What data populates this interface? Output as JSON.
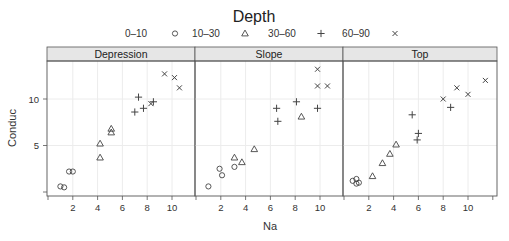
{
  "chart_data": {
    "type": "scatter",
    "title": "Depth",
    "xlabel": "Na",
    "ylabel": "Conduc",
    "xlim": [
      0,
      12
    ],
    "ylim": [
      0,
      14
    ],
    "xticks": [
      2,
      4,
      6,
      8,
      10
    ],
    "yticks": [
      5,
      10
    ],
    "grid": true,
    "legend_position": "top",
    "legend": [
      {
        "label": "0-10",
        "symbol": "circle"
      },
      {
        "label": "10-30",
        "symbol": "triangle"
      },
      {
        "label": "30-60",
        "symbol": "plus"
      },
      {
        "label": "60-90",
        "symbol": "cross"
      }
    ],
    "panels": [
      {
        "name": "Depression",
        "series": [
          {
            "name": "0-10",
            "x": [
              1.0,
              1.3,
              1.7,
              2.0
            ],
            "y": [
              0.6,
              0.5,
              2.2,
              2.2
            ]
          },
          {
            "name": "10-30",
            "x": [
              4.2,
              4.2,
              5.1,
              5.1
            ],
            "y": [
              5.2,
              3.7,
              6.8,
              6.4
            ]
          },
          {
            "name": "30-60",
            "x": [
              7.3,
              7.0,
              7.7,
              8.5
            ],
            "y": [
              10.2,
              8.6,
              9.0,
              9.7
            ]
          },
          {
            "name": "60-90",
            "x": [
              8.3,
              9.4,
              10.2,
              10.6
            ],
            "y": [
              9.5,
              12.7,
              12.3,
              11.2
            ]
          }
        ]
      },
      {
        "name": "Slope",
        "series": [
          {
            "name": "0-10",
            "x": [
              1.0,
              1.9,
              2.1,
              3.1
            ],
            "y": [
              0.6,
              2.5,
              1.8,
              2.7
            ]
          },
          {
            "name": "10-30",
            "x": [
              3.1,
              3.7,
              4.7,
              8.5
            ],
            "y": [
              3.7,
              3.2,
              4.6,
              8.1
            ]
          },
          {
            "name": "30-60",
            "x": [
              6.5,
              6.6,
              8.1,
              9.8
            ],
            "y": [
              9.0,
              7.6,
              9.7,
              9.0
            ]
          },
          {
            "name": "60-90",
            "x": [
              9.8,
              9.8,
              10.6
            ],
            "y": [
              13.2,
              11.4,
              11.4
            ]
          }
        ]
      },
      {
        "name": "Top",
        "series": [
          {
            "name": "0-10",
            "x": [
              0.7,
              1.0,
              1.2,
              1.0
            ],
            "y": [
              1.2,
              1.4,
              1.0,
              0.9
            ]
          },
          {
            "name": "10-30",
            "x": [
              2.3,
              3.1,
              3.7,
              4.2
            ],
            "y": [
              1.7,
              3.1,
              4.1,
              5.1
            ]
          },
          {
            "name": "30-60",
            "x": [
              5.5,
              6.0,
              5.9,
              8.6
            ],
            "y": [
              8.3,
              6.3,
              5.6,
              9.1
            ]
          },
          {
            "name": "60-90",
            "x": [
              8.0,
              9.1,
              10.0,
              11.4
            ],
            "y": [
              10.0,
              11.2,
              10.5,
              12.0
            ]
          }
        ]
      }
    ]
  },
  "colors": {
    "strip_bg": "#e6e6e6",
    "frame": "#555555",
    "grid": "#ececec",
    "point": "#444444"
  }
}
